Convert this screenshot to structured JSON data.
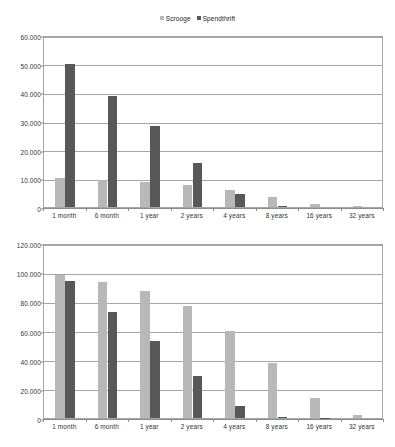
{
  "legend": {
    "position": "top-center",
    "entries": [
      {
        "label": "Scrooge",
        "color": "#b8b8b8",
        "marker": "square-marker"
      },
      {
        "label": "Spendthrift",
        "color": "#585858",
        "marker": "square-marker"
      }
    ]
  },
  "colors": {
    "series_scrooge": "#b8b8b8",
    "series_spendthrift": "#585858",
    "gridline": "#a6a6a6",
    "axis": "#8c8c8c",
    "text": "#333333",
    "background": "#ffffff"
  },
  "chart_data": [
    {
      "id": "top",
      "type": "bar",
      "title": "",
      "subtitle": "",
      "xlabel": "",
      "ylabel": "",
      "grid": true,
      "legend": "top-center",
      "categories": [
        "1 month",
        "6 month",
        "1 year",
        "2 years",
        "4 years",
        "8 years",
        "16 years",
        "32 years"
      ],
      "ylim": [
        0,
        60000
      ],
      "ytick_step": 10000,
      "ytick_labels": [
        "0",
        "10.000",
        "20.000",
        "30.000",
        "40.000",
        "50.000",
        "60.000"
      ],
      "ytick_values": [
        0,
        10000,
        20000,
        30000,
        40000,
        50000,
        60000
      ],
      "series": [
        {
          "name": "Scrooge",
          "color": "#b8b8b8",
          "values": [
            10000,
            9500,
            8700,
            7800,
            6000,
            3600,
            1200,
            200
          ]
        },
        {
          "name": "Spendthrift",
          "color": "#585858",
          "values": [
            50000,
            38600,
            28300,
            15200,
            4500,
            300,
            0,
            0
          ]
        }
      ]
    },
    {
      "id": "bottom",
      "type": "bar",
      "title": "",
      "subtitle": "",
      "xlabel": "",
      "ylabel": "",
      "grid": true,
      "legend": "none",
      "categories": [
        "1 month",
        "6 month",
        "1 year",
        "2 years",
        "4 years",
        "8 years",
        "16 years",
        "32 years"
      ],
      "ylim": [
        0,
        120000
      ],
      "ytick_step": 20000,
      "ytick_labels": [
        "0",
        "20.000",
        "40.000",
        "60.000",
        "80.000",
        "100.000",
        "120.000"
      ],
      "ytick_values": [
        0,
        20000,
        40000,
        60000,
        80000,
        100000,
        120000
      ],
      "series": [
        {
          "name": "Scrooge",
          "color": "#b8b8b8",
          "values": [
            98000,
            93000,
            87000,
            77000,
            60000,
            38000,
            14000,
            2000
          ]
        },
        {
          "name": "Spendthrift",
          "color": "#585858",
          "values": [
            94000,
            73000,
            53000,
            29000,
            8000,
            800,
            200,
            0
          ]
        }
      ]
    }
  ]
}
